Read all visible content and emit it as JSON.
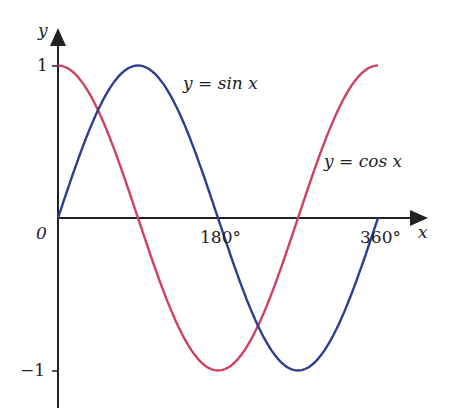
{
  "chart_data": {
    "type": "line",
    "title": "",
    "xlabel": "x",
    "ylabel": "y",
    "x_ticks": [
      "180°",
      "360°"
    ],
    "y_ticks": [
      "1",
      "−1"
    ],
    "origin_label": "0",
    "xlim": [
      0,
      360
    ],
    "ylim": [
      -1,
      1
    ],
    "grid": false,
    "series": [
      {
        "name": "y = sin x",
        "color": "#2d3e8f",
        "x": [
          0,
          90,
          180,
          270,
          360
        ],
        "values": [
          0,
          1,
          0,
          -1,
          0
        ]
      },
      {
        "name": "y = cos x",
        "color": "#d04060",
        "x": [
          0,
          90,
          180,
          270,
          360
        ],
        "values": [
          1,
          0,
          -1,
          0,
          1
        ]
      }
    ]
  },
  "labels": {
    "y_axis": "y",
    "x_axis": "x",
    "origin": "0",
    "tick_1": "1",
    "tick_neg1": "−1",
    "tick_180": "180°",
    "tick_360": "360°",
    "sin_label": "y = sin x",
    "cos_label": "y = cos x"
  }
}
